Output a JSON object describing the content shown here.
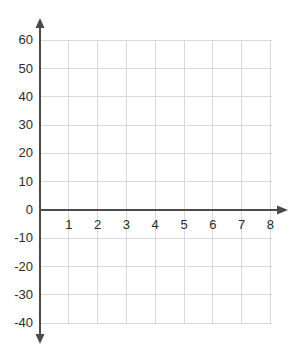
{
  "chart_data": {
    "type": "line",
    "title": "",
    "subtitle": "",
    "xlabel": "",
    "ylabel": "",
    "series": [],
    "x": [],
    "values": [],
    "xlim": [
      0,
      8.8
    ],
    "ylim": [
      -45,
      65
    ],
    "x_ticks": [
      1,
      2,
      3,
      4,
      5,
      6,
      7,
      8
    ],
    "x_tick_labels": [
      "1",
      "2",
      "3",
      "4",
      "5",
      "6",
      "7",
      "8"
    ],
    "y_ticks": [
      60,
      50,
      40,
      30,
      20,
      10,
      0,
      -10,
      -20,
      -30,
      -40
    ],
    "y_tick_labels": [
      "60",
      "50",
      "40",
      "30",
      "20",
      "10",
      "0",
      "-10",
      "-20",
      "-30",
      "-40"
    ],
    "grid": true,
    "legend": null,
    "legend_position": "none",
    "annotations": [],
    "axes": {
      "x_axis_arrow": "right",
      "y_axis_arrow": "both",
      "origin_label": "0"
    },
    "colors": {
      "grid": "#d9d9dd",
      "axis": "#4b4b4b",
      "text": "#2b2b2b",
      "background": "#ffffff"
    }
  },
  "geometry": {
    "origin_x": 40,
    "origin_y": 210,
    "x_step": 28.8,
    "y_step": 28.3,
    "grid_right": 272,
    "grid_top": 41,
    "grid_bottom": 323,
    "x_arrow_tip": 288,
    "y_arrow_top": 18,
    "y_arrow_bottom": 344
  }
}
